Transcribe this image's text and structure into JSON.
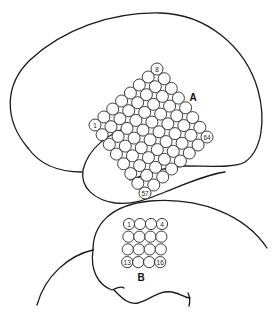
{
  "figure": {
    "panel_a": {
      "label": "A",
      "grid_rows": 8,
      "grid_cols": 8,
      "electrode_count": 64,
      "corner_labels": {
        "left": "1",
        "top": "8",
        "bottom": "57",
        "right": "64"
      }
    },
    "panel_b": {
      "label": "B",
      "grid_rows": 4,
      "grid_cols": 4,
      "electrode_count": 16,
      "corner_labels": {
        "top_left": "1",
        "top_right": "4",
        "bottom_left": "13",
        "bottom_right": "16"
      }
    },
    "colors": {
      "stroke": "#1a1a1a",
      "background": "#ffffff"
    }
  }
}
